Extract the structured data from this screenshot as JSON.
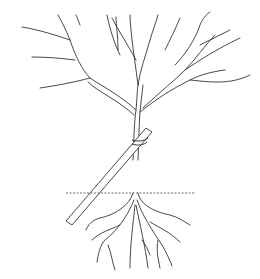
{
  "image": {
    "subject": "staked young tree with bare branches and roots",
    "background": "#ffffff",
    "stroke": "#333333",
    "elements": [
      "branches",
      "trunk",
      "stake",
      "tie",
      "ground-line",
      "roots"
    ]
  }
}
